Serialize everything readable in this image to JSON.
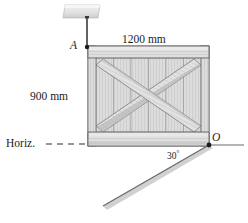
{
  "figure": {
    "name": "crate-suspended-on-incline",
    "width": 248,
    "height": 223,
    "background_color": "#ffffff",
    "line_color": "#4a4a4a",
    "dark_line_color": "#333333",
    "crate_face_color": "#d7d7d7",
    "crate_light_color": "#e3e3e3",
    "crate_shadow_color": "#bdbdbd",
    "ceiling_color": "#e0e0e0",
    "incline_color": "#8a8a8a"
  },
  "labels": {
    "width_dimension": "1200 mm",
    "height_dimension": "900 mm",
    "point_a": "A",
    "point_o": "O",
    "horizontal_reference": "Horiz.",
    "angle_value": "30",
    "angle_unit": "°"
  },
  "geometry": {
    "ceiling_block": {
      "x": 63,
      "y": 5,
      "width": 37,
      "height": 13
    },
    "cable": {
      "x1": 87,
      "y1": 17,
      "x2": 87,
      "y2": 48
    },
    "point_a": {
      "x": 87,
      "y": 47
    },
    "point_o": {
      "x": 209,
      "y": 145
    },
    "crate": {
      "left": 88,
      "top": 46,
      "right": 209,
      "bottom": 146
    },
    "incline_angle_degrees": 30,
    "horizontal_dashes": 4,
    "vertical_slat_count": 6,
    "diagonal_brace_count": 2
  }
}
